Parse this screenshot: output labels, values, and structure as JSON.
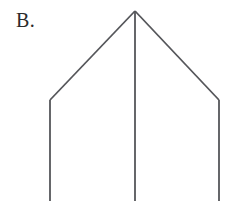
{
  "figure": {
    "panel_label": "B.",
    "canvas": {
      "width": 226,
      "height": 201,
      "background": "#ffffff"
    },
    "stroke": {
      "color": "#55565a",
      "width": 1.8
    },
    "label_position": {
      "x": 16,
      "y": 9,
      "font_size": 20,
      "color": "#2b2b2b"
    },
    "points": {
      "apex": {
        "x": 135,
        "y": 11
      },
      "left_shoulder": {
        "x": 50,
        "y": 100
      },
      "right_shoulder": {
        "x": 219,
        "y": 100
      },
      "left_foot": {
        "x": 50,
        "y": 201
      },
      "center_foot": {
        "x": 135,
        "y": 201
      },
      "right_foot": {
        "x": 219,
        "y": 201
      }
    },
    "segments": [
      {
        "name": "left-diagonal",
        "from": "apex",
        "to": "left_shoulder"
      },
      {
        "name": "right-diagonal",
        "from": "apex",
        "to": "right_shoulder"
      },
      {
        "name": "left-vertical",
        "from": "left_shoulder",
        "to": "left_foot"
      },
      {
        "name": "center-vertical",
        "from": "apex",
        "to": "center_foot"
      },
      {
        "name": "right-vertical",
        "from": "right_shoulder",
        "to": "right_foot"
      }
    ]
  }
}
